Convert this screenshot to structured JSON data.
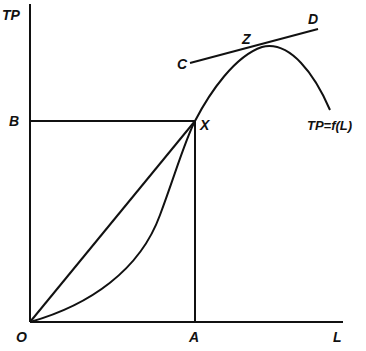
{
  "diagram": {
    "type": "economics-production-function",
    "axis_labels": {
      "y": "TP",
      "x": "L",
      "origin": "O"
    },
    "points": {
      "B": "B",
      "A": "A",
      "X": "X",
      "Z": "Z",
      "C": "C",
      "D": "D"
    },
    "curve_label": "TP=f(L)",
    "elements": [
      "vertical axis TP",
      "horizontal axis L",
      "total product curve TP=f(L) rising from O, through X, peaking near Z, then declining",
      "ray from O to X",
      "horizontal line from B to X",
      "vertical line from X to A",
      "tangent line CD touching curve at Z"
    ],
    "colors": {
      "ink": "#111111",
      "background": "#ffffff"
    }
  }
}
